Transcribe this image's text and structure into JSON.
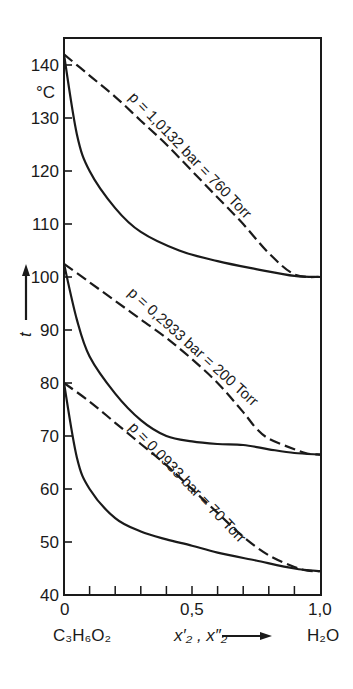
{
  "chart_data": {
    "type": "line",
    "title": "",
    "xlabel": "x'2, x\"2",
    "ylabel": "t",
    "y_unit": "°C",
    "xlim": [
      0,
      1.0
    ],
    "ylim": [
      40,
      145
    ],
    "x_ticks": [
      0,
      0.1,
      0.2,
      0.3,
      0.4,
      0.5,
      0.6,
      0.7,
      0.8,
      0.9,
      1.0
    ],
    "x_tick_labels": [
      "0",
      "0,5",
      "1,0"
    ],
    "y_ticks": [
      40,
      50,
      60,
      70,
      80,
      90,
      100,
      110,
      120,
      130,
      140
    ],
    "y_tick_labels": [
      "40",
      "50",
      "60",
      "70",
      "80",
      "90",
      "100",
      "110",
      "120",
      "130",
      "140"
    ],
    "x_left_component": "C3H6O2",
    "x_right_component": "H2O",
    "grid": false,
    "legend": "inline curve labels",
    "series": [
      {
        "name": "p = 1,0132 bar = 760 Torr (liquid, boiling curve)",
        "style": "solid",
        "x": [
          0,
          0.05,
          0.1,
          0.2,
          0.3,
          0.45,
          0.6,
          0.75,
          0.9,
          1.0
        ],
        "y": [
          142,
          127,
          120,
          113,
          108.5,
          105,
          103,
          101.5,
          100.2,
          100
        ]
      },
      {
        "name": "p = 1,0132 bar = 760 Torr (vapour, dew curve)",
        "style": "dashed",
        "x": [
          0,
          0.1,
          0.2,
          0.3,
          0.4,
          0.5,
          0.6,
          0.7,
          0.8,
          0.9,
          1.0
        ],
        "y": [
          142,
          138,
          134,
          129.5,
          125,
          120,
          115,
          110,
          104.5,
          100.5,
          100
        ]
      },
      {
        "name": "p = 0,2933 bar = 200 Torr (liquid, boiling curve)",
        "style": "solid",
        "x": [
          0,
          0.05,
          0.1,
          0.2,
          0.3,
          0.4,
          0.5,
          0.6,
          0.7,
          0.8,
          0.9,
          1.0
        ],
        "y": [
          102.5,
          92,
          85,
          78,
          73,
          70,
          69,
          68.5,
          68.3,
          67.5,
          66.8,
          66.5
        ]
      },
      {
        "name": "p = 0,2933 bar = 200 Torr (vapour, dew curve)",
        "style": "dashed",
        "x": [
          0,
          0.1,
          0.2,
          0.3,
          0.4,
          0.5,
          0.6,
          0.7,
          0.75,
          0.8,
          0.9,
          0.95,
          1.0
        ],
        "y": [
          102.5,
          99,
          95.5,
          92,
          88.5,
          84.5,
          80,
          74.5,
          71.5,
          69.5,
          67.5,
          66.7,
          66.5
        ]
      },
      {
        "name": "p = 0,0933 bar = 70 Torr (liquid, boiling curve)",
        "style": "solid",
        "x": [
          0,
          0.05,
          0.1,
          0.2,
          0.3,
          0.4,
          0.5,
          0.6,
          0.75,
          0.9,
          1.0
        ],
        "y": [
          80,
          66,
          60,
          54.5,
          52,
          50.5,
          49.3,
          48,
          46.5,
          45,
          44.5
        ]
      },
      {
        "name": "p = 0,0933 bar = 70 Torr (vapour, dew curve)",
        "style": "dashed",
        "x": [
          0,
          0.1,
          0.2,
          0.3,
          0.4,
          0.5,
          0.6,
          0.7,
          0.8,
          0.9,
          0.95,
          1.0
        ],
        "y": [
          80,
          76.5,
          72.5,
          68.5,
          64.5,
          60,
          55.5,
          51,
          47.5,
          45.3,
          44.6,
          44.5
        ]
      }
    ],
    "annotations": [
      {
        "text": "p = 1,0132 bar = 760 Torr",
        "near_series": 1
      },
      {
        "text": "p = 0,2933 bar = 200 Torr",
        "near_series": 3
      },
      {
        "text": "p = 0,0933 bar = 70 Torr",
        "near_series": 5
      }
    ]
  },
  "labels": {
    "y_unit": "°C",
    "y_axis_symbol": "t",
    "x_axis_symbol": "x′₂ , x″₂",
    "x_left_component": "C₃H₆O₂",
    "x_right_component": "H₂O",
    "x_tick_0": "0",
    "x_tick_mid": "0,5",
    "x_tick_1": "1,0",
    "curve_760": "p = 1,0132 bar = 760 Torr",
    "curve_200": "p = 0,2933 bar = 200 Torr",
    "curve_70": "p = 0,0933 bar = 70 Torr"
  },
  "colors": {
    "ink": "#1a1a1a",
    "background": "#ffffff"
  }
}
